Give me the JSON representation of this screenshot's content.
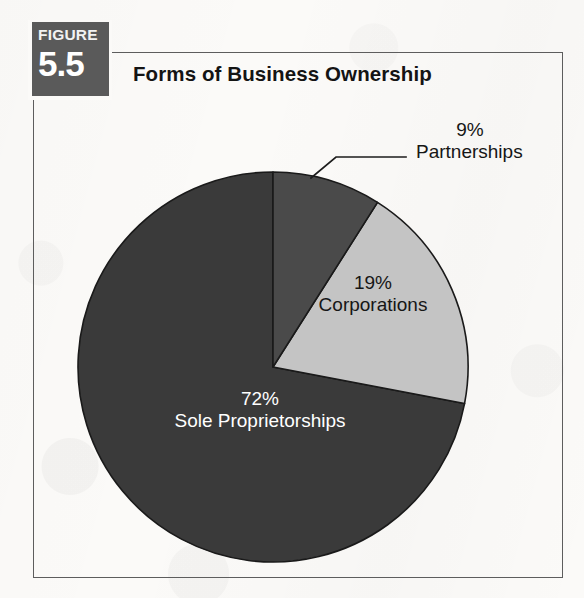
{
  "figure": {
    "badge_word": "FIGURE",
    "badge_number": "5.5",
    "title": "Forms of Business Ownership"
  },
  "colors": {
    "sole_proprietorships": "#3a3a3a",
    "partnerships": "#4a4a4a",
    "corporations": "#c4c4c4",
    "slice_outline": "#1a1a1a",
    "frame": "#5d5d5d",
    "badge_background": "#5a5a5a",
    "page_background": "#fbfaf8",
    "title_text": "#141414",
    "dark_label_text": "#ffffff",
    "light_label_text": "#161616"
  },
  "chart_data": {
    "type": "pie",
    "title": "Forms of Business Ownership",
    "xlabel": "",
    "ylabel": "",
    "legend_position": "none",
    "grid": false,
    "start_angle_deg": 0,
    "direction": "clockwise",
    "categories": [
      "Partnerships",
      "Corporations",
      "Sole Proprietorships"
    ],
    "values": [
      9,
      19,
      72
    ],
    "unit": "%",
    "slices": [
      {
        "label": "Partnerships",
        "value": 9,
        "value_text": "9%",
        "color": "#4a4a4a",
        "start_deg": 0,
        "end_deg": 32.4,
        "label_placement": "outside-leader-line"
      },
      {
        "label": "Corporations",
        "value": 19,
        "value_text": "19%",
        "color": "#c4c4c4",
        "start_deg": 32.4,
        "end_deg": 100.8,
        "label_placement": "inside"
      },
      {
        "label": "Sole Proprietorships",
        "value": 72,
        "value_text": "72%",
        "color": "#3a3a3a",
        "start_deg": 100.8,
        "end_deg": 360,
        "label_placement": "inside"
      }
    ],
    "annotations": [
      {
        "text": "9% Partnerships",
        "target_slice": "Partnerships",
        "has_leader_line": true
      }
    ]
  },
  "labels": {
    "partnerships": {
      "percent": "9%",
      "name": "Partnerships"
    },
    "corporations": {
      "percent": "19%",
      "name": "Corporations"
    },
    "sole_proprietorships": {
      "percent": "72%",
      "name": "Sole Proprietorships"
    }
  }
}
